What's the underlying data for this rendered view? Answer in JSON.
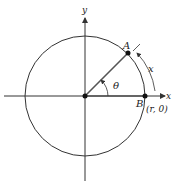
{
  "diagram": {
    "axes": {
      "x_label": "x",
      "y_label": "y"
    },
    "points": {
      "origin": {
        "label": ""
      },
      "A": {
        "label": "A"
      },
      "B": {
        "label": "B",
        "coordinate_label": "(r, 0)"
      }
    },
    "angle_label": "θ",
    "arc_label": "x",
    "colors": {
      "stroke": "#333333",
      "point": "#111111",
      "background": "#ffffff"
    }
  }
}
